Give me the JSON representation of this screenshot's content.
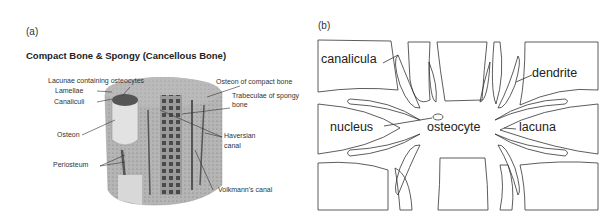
{
  "panel_a": {
    "label": "(a)",
    "title": "Compact Bone & Spongy (Cancellous Bone)",
    "annotations": {
      "lacunae": "Lacunae containing osteocytes",
      "lamellae": "Lamellae",
      "canaliculi": "Canaliculi",
      "osteon_compact": "Osteon of compact bone",
      "trabeculae_1": "Trabeculae of spongy",
      "trabeculae_2": "bone",
      "osteon": "Osteon",
      "haversian_1": "Haversian",
      "haversian_2": "canal",
      "periosteum": "Periosteum",
      "volkmann": "Volkmann's canal"
    }
  },
  "panel_b": {
    "label": "(b)",
    "annotations": {
      "canalicula": "canalicula",
      "dendrite": "dendrite",
      "nucleus": "nucleus",
      "osteocyte": "osteocyte",
      "lacuna": "lacuna"
    }
  }
}
